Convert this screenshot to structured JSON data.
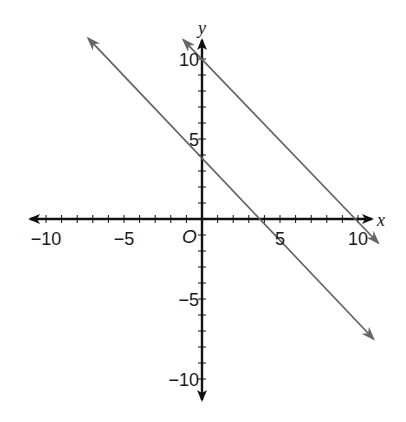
{
  "chart_data": {
    "type": "line",
    "title": "",
    "xlabel": "x",
    "ylabel": "y",
    "origin_label": "O",
    "xlim": [
      -11,
      11
    ],
    "ylim": [
      -11,
      11
    ],
    "grid": false,
    "x_ticks": [
      -10,
      -9,
      -8,
      -7,
      -6,
      -5,
      -4,
      -3,
      -2,
      -1,
      1,
      2,
      3,
      4,
      5,
      6,
      7,
      8,
      9,
      10
    ],
    "y_ticks": [
      -10,
      -9,
      -8,
      -7,
      -6,
      -5,
      -4,
      -3,
      -2,
      -1,
      1,
      2,
      3,
      4,
      5,
      6,
      7,
      8,
      9,
      10
    ],
    "x_tick_labels": [
      {
        "value": -10,
        "label": "−10"
      },
      {
        "value": -5,
        "label": "−5"
      },
      {
        "value": 5,
        "label": "5"
      },
      {
        "value": 10,
        "label": "10"
      }
    ],
    "y_tick_labels": [
      {
        "value": 10,
        "label": "10"
      },
      {
        "value": 5,
        "label": "5"
      },
      {
        "value": -5,
        "label": "−5"
      },
      {
        "value": -10,
        "label": "−10"
      }
    ],
    "series": [
      {
        "name": "y = -x + 4",
        "slope": -1,
        "intercept": 4,
        "x": [
          -7.3,
          11.0
        ],
        "y": [
          11.3,
          -7.5
        ],
        "color": "#666666",
        "arrows": "both"
      },
      {
        "name": "y = -x + 10",
        "slope": -1,
        "intercept": 10,
        "x": [
          -1.2,
          11.3
        ],
        "y": [
          11.2,
          -1.5
        ],
        "color": "#666666",
        "arrows": "both"
      }
    ],
    "colors": {
      "axes": "#111111",
      "lines": "#666666",
      "background": "#ffffff"
    }
  }
}
